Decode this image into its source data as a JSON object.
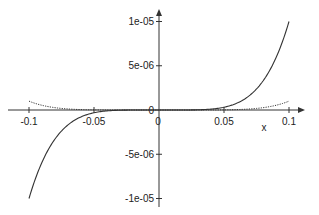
{
  "chart_data": {
    "type": "line",
    "title": "",
    "xlabel": "x",
    "ylabel": "",
    "xlim": [
      -0.1,
      0.1
    ],
    "ylim": [
      -1e-05,
      1e-05
    ],
    "grid": false,
    "legend": null,
    "x_ticks": [
      {
        "value": -0.1,
        "label": "-0.1"
      },
      {
        "value": -0.05,
        "label": "-0.05"
      },
      {
        "value": 0,
        "label": "0"
      },
      {
        "value": 0.05,
        "label": "0.05"
      },
      {
        "value": 0.1,
        "label": "0.1"
      }
    ],
    "y_ticks": [
      {
        "value": 1e-05,
        "label": "1e-05"
      },
      {
        "value": 5e-06,
        "label": "5e-06"
      },
      {
        "value": 0,
        "label": "0"
      },
      {
        "value": -5e-06,
        "label": "-5e-06"
      },
      {
        "value": -1e-05,
        "label": "-1e-05"
      }
    ],
    "series": [
      {
        "name": "x^5",
        "style": "solid",
        "x": [
          -0.1,
          -0.075,
          -0.05,
          -0.025,
          0,
          0.025,
          0.05,
          0.075,
          0.1
        ],
        "values": [
          -1e-05,
          -2.37e-06,
          -3.1e-07,
          -1e-08,
          0,
          1e-08,
          3.1e-07,
          2.37e-06,
          1e-05
        ]
      },
      {
        "name": "x^6",
        "style": "dotted",
        "x": [
          -0.1,
          -0.075,
          -0.05,
          -0.025,
          0,
          0.025,
          0.05,
          0.075,
          0.1
        ],
        "values": [
          1e-06,
          1.8e-07,
          1.6e-08,
          2e-10,
          0,
          2e-10,
          1.6e-08,
          1.8e-07,
          1e-06
        ]
      }
    ]
  },
  "labels": {
    "x_axis": "x"
  }
}
